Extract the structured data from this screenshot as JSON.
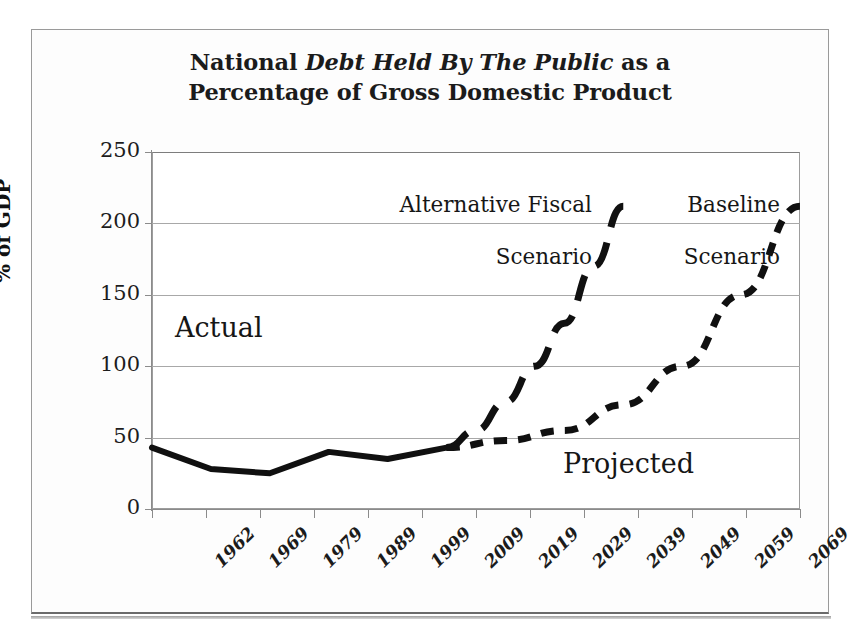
{
  "chart_data": {
    "type": "line",
    "title": "National Debt Held By The Public as a Percentage of Gross Domestic Product",
    "title_line1_pre": "National ",
    "title_line1_em": "Debt Held By The Public",
    "title_line1_post": " as a",
    "title_line2": "Percentage of Gross Domestic Product",
    "xlabel": "",
    "ylabel": "% of GDP",
    "ylim": [
      0,
      250
    ],
    "ytick_values": [
      250,
      200,
      150,
      100,
      50,
      0
    ],
    "ytick_labels": [
      "250",
      "200",
      "150",
      "100",
      "50",
      "0"
    ],
    "grid": true,
    "legend_position": "inline-annotations",
    "categories": [
      "1962",
      "1969",
      "1979",
      "1989",
      "1999",
      "2009",
      "2019",
      "2029",
      "2039",
      "2049",
      "2059",
      "2069"
    ],
    "series": [
      {
        "name": "Actual",
        "style": "solid",
        "x": [
          "1962",
          "1969",
          "1979",
          "1989",
          "1999",
          "2009"
        ],
        "values": [
          43,
          28,
          25,
          40,
          35,
          43
        ]
      },
      {
        "name": "Alternative Fiscal Scenario",
        "style": "long-dash",
        "x": [
          "2009",
          "2014",
          "2019",
          "2024",
          "2029",
          "2034",
          "2039"
        ],
        "values": [
          43,
          55,
          75,
          100,
          130,
          170,
          212
        ]
      },
      {
        "name": "Baseline Scenario",
        "style": "short-dash",
        "x": [
          "2009",
          "2019",
          "2029",
          "2039",
          "2049",
          "2059",
          "2069"
        ],
        "values": [
          43,
          48,
          55,
          73,
          100,
          150,
          212
        ]
      }
    ],
    "annotations": [
      {
        "text": "Actual",
        "near_x": "1979",
        "near_y": 125
      },
      {
        "text": "Projected",
        "near_x": "2049",
        "near_y": 30
      },
      {
        "text": "Alternative Fiscal\nScenario",
        "near_x": "2029",
        "near_y": 235
      },
      {
        "text": "Baseline\nScenario",
        "near_x": "2059",
        "near_y": 235
      }
    ]
  },
  "colors": {
    "line": "#101010",
    "grid": "#a8a8a8",
    "axis": "#8b8b8b",
    "text": "#161616",
    "background": "#ffffff"
  },
  "annotations": {
    "actual": "Actual",
    "projected": "Projected",
    "alternative_line1": "Alternative Fiscal",
    "alternative_line2": "Scenario",
    "baseline_line1": "Baseline",
    "baseline_line2": "Scenario"
  },
  "axes": {
    "y_title": "% of GDP"
  }
}
